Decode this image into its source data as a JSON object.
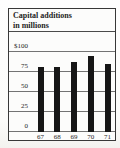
{
  "chart": {
    "title_line1": "Capital additions",
    "title_line2": "in millions"
  },
  "chart_data": {
    "type": "bar",
    "title": "Capital additions in millions",
    "categories": [
      "67",
      "68",
      "69",
      "70",
      "71"
    ],
    "values": [
      80,
      80,
      86,
      94,
      84
    ],
    "xlabel": "",
    "ylabel": "",
    "y_ticks": [
      "$100",
      "75",
      "50",
      "25",
      "0"
    ],
    "y_tick_values": [
      100,
      75,
      50,
      25,
      0
    ],
    "ylim": [
      0,
      100
    ],
    "grid": "horizontal",
    "legend": "none",
    "bar_color": "#161616",
    "gridline_color": "#737373",
    "frame_color": "#383838",
    "text_color": "#1e1e1e"
  }
}
